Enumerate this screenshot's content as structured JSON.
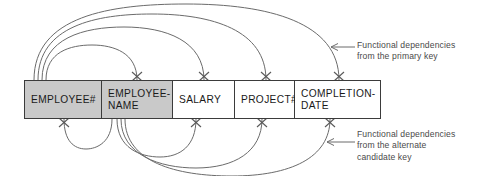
{
  "diagram": {
    "table": {
      "name": "attribute-table",
      "columns": [
        {
          "label": "EMPLOYEE#",
          "shaded": true,
          "role": "primary-key"
        },
        {
          "label": "EMPLOYEE-\nNAME",
          "shaded": true,
          "role": "alternate-candidate-key"
        },
        {
          "label": "SALARY",
          "shaded": false,
          "role": "attribute"
        },
        {
          "label": "PROJECT#",
          "shaded": false,
          "role": "attribute"
        },
        {
          "label": "COMPLETION-\nDATE",
          "shaded": false,
          "role": "attribute"
        }
      ]
    },
    "annotations": [
      {
        "id": "primary",
        "text": "Functional dependencies\nfrom the primary key",
        "arrow": "left-arrow-icon"
      },
      {
        "id": "alternate",
        "text": "Functional dependencies\nfrom the alternate\ncandidate key",
        "arrow": "left-arrow-icon"
      }
    ],
    "dependencies": {
      "from_primary_key": {
        "source": "EMPLOYEE#",
        "targets": [
          "EMPLOYEE-NAME",
          "SALARY",
          "PROJECT#",
          "COMPLETION-DATE"
        ],
        "side": "above"
      },
      "from_alternate_key": {
        "source": "EMPLOYEE-NAME",
        "targets": [
          "EMPLOYEE#",
          "SALARY",
          "PROJECT#",
          "COMPLETION-DATE"
        ],
        "side": "below"
      }
    },
    "colors": {
      "key_fill": "#c9c9c9",
      "plain_fill": "#ffffff",
      "border": "#3b3b3b",
      "arc": "#6b6b6b",
      "text": "#1a1a1a",
      "annotation_text": "#4a4a4a"
    }
  }
}
